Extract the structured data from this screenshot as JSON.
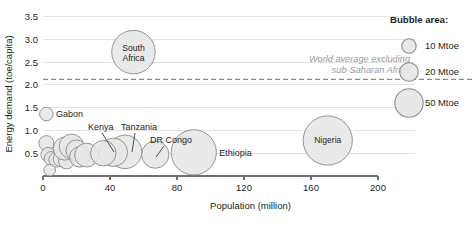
{
  "chart_data": {
    "type": "scatter",
    "title": "",
    "xlabel": "Population (million)",
    "ylabel": "Energy demand (toe/capita)",
    "xlim": [
      0,
      200
    ],
    "ylim": [
      0,
      3.6
    ],
    "xticks": [
      0,
      40,
      80,
      120,
      160,
      200
    ],
    "yticks": [
      0.5,
      1.0,
      1.5,
      2.0,
      2.5,
      3.0,
      3.5
    ],
    "xtick_labels": [
      "0",
      "40",
      "80",
      "120",
      "160",
      "200"
    ],
    "ytick_labels": [
      "0.5",
      "1.0",
      "1.5",
      "2.0",
      "2.5",
      "3.0",
      "3.5"
    ],
    "grid": "horizontal",
    "legend_position": "right",
    "size_encoding": "bubble area = total energy demand (Mtoe)",
    "reference_line": {
      "value": 2.12,
      "style": "dashed",
      "label": "World average excluding sub-Saharan Africa",
      "label_line1": "World average excluding",
      "label_line2": "sub-Saharan Africa"
    },
    "points": [
      {
        "name": "South Africa",
        "x": 54,
        "y": 2.72,
        "size": 92,
        "label": "South Africa",
        "label_mode": "inside",
        "label_line1": "South",
        "label_line2": "Africa"
      },
      {
        "name": "Nigeria",
        "x": 170,
        "y": 0.78,
        "size": 120,
        "label": "Nigeria",
        "label_mode": "inside"
      },
      {
        "name": "Ethiopia",
        "x": 90,
        "y": 0.52,
        "size": 100,
        "label": "Ethiopia",
        "label_mode": "right"
      },
      {
        "name": "DR Congo",
        "x": 67,
        "y": 0.47,
        "size": 33,
        "label": "DR Congo",
        "label_mode": "callout"
      },
      {
        "name": "Tanzania",
        "x": 49,
        "y": 0.53,
        "size": 52,
        "label": "Tanzania",
        "label_mode": "callout"
      },
      {
        "name": "Kenya",
        "x": 42,
        "y": 0.52,
        "size": 36,
        "label": "Kenya",
        "label_mode": "callout"
      },
      {
        "name": "Gabon",
        "x": 2,
        "y": 1.36,
        "size": 6,
        "label": "Gabon",
        "label_mode": "right"
      },
      {
        "name": "unlabelled-1",
        "x": 2,
        "y": 0.72,
        "size": 8,
        "label": "",
        "label_mode": "none"
      },
      {
        "name": "unlabelled-2",
        "x": 3,
        "y": 0.47,
        "size": 7,
        "label": "",
        "label_mode": "none"
      },
      {
        "name": "unlabelled-3",
        "x": 5,
        "y": 0.38,
        "size": 7,
        "label": "",
        "label_mode": "none"
      },
      {
        "name": "unlabelled-4",
        "x": 8,
        "y": 0.36,
        "size": 8,
        "label": "",
        "label_mode": "none"
      },
      {
        "name": "unlabelled-5",
        "x": 11,
        "y": 0.38,
        "size": 10,
        "label": "",
        "label_mode": "none"
      },
      {
        "name": "unlabelled-6",
        "x": 14,
        "y": 0.33,
        "size": 9,
        "label": "",
        "label_mode": "none"
      },
      {
        "name": "unlabelled-7",
        "x": 13,
        "y": 0.6,
        "size": 22,
        "label": "",
        "label_mode": "none"
      },
      {
        "name": "unlabelled-8",
        "x": 17,
        "y": 0.65,
        "size": 26,
        "label": "",
        "label_mode": "none"
      },
      {
        "name": "unlabelled-9",
        "x": 20,
        "y": 0.56,
        "size": 18,
        "label": "",
        "label_mode": "none"
      },
      {
        "name": "unlabelled-10",
        "x": 22,
        "y": 0.42,
        "size": 17,
        "label": "",
        "label_mode": "none"
      },
      {
        "name": "unlabelled-11",
        "x": 26,
        "y": 0.46,
        "size": 24,
        "label": "",
        "label_mode": "none"
      },
      {
        "name": "unlabelled-12",
        "x": 36,
        "y": 0.5,
        "size": 28,
        "label": "",
        "label_mode": "none"
      },
      {
        "name": "unlabelled-13",
        "x": 4,
        "y": 0.13,
        "size": 4,
        "label": "",
        "label_mode": "none"
      }
    ]
  },
  "legend": {
    "title": "Bubble area:",
    "items": [
      {
        "label": "10 Mtoe",
        "size": 10
      },
      {
        "label": "20 Mtoe",
        "size": 20
      },
      {
        "label": "50 Mtoe",
        "size": 50
      }
    ]
  }
}
